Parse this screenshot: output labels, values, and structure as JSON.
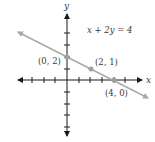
{
  "title": "",
  "equation": "x + 2y = 4",
  "axes": {
    "x_label": "x",
    "y_label": "y",
    "x_range": [
      -4,
      5
    ],
    "y_range": [
      -5,
      5
    ],
    "tick_spacing": 1
  },
  "points": [
    {
      "x": 0,
      "y": 2,
      "label": "(0, 2)"
    },
    {
      "x": 2,
      "y": 1,
      "label": "(2, 1)"
    },
    {
      "x": 4,
      "y": 0,
      "label": "(4, 0)"
    }
  ],
  "line": {
    "slope": -0.5,
    "intercept": 2,
    "color": "#a9a9a9"
  },
  "colors": {
    "axis": "#1a1a1a",
    "line": "#a9a9a9",
    "points": "#a0a0a0",
    "text": "#3a3a3a"
  }
}
